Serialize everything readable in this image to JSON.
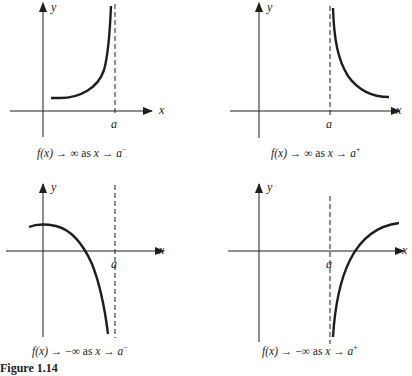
{
  "figure": {
    "caption_label": "Figure 1.14",
    "stroke_color": "#1e1e1e",
    "panels": [
      {
        "id": "top-left",
        "axis_labels": {
          "x": "x",
          "y": "y",
          "asymptote": "a"
        },
        "caption": {
          "f": "f(x)",
          "arrow1": "→",
          "limit": "∞",
          "as": "as",
          "x": "x",
          "arrow2": "→",
          "a": "a",
          "side": "−"
        },
        "description": "f(x) → ∞ as x → a⁻"
      },
      {
        "id": "top-right",
        "axis_labels": {
          "x": "x",
          "y": "y",
          "asymptote": "a"
        },
        "caption": {
          "f": "f(x)",
          "arrow1": "→",
          "limit": "∞",
          "as": "as",
          "x": "x",
          "arrow2": "→",
          "a": "a",
          "side": "+"
        },
        "description": "f(x) → ∞ as x → a⁺"
      },
      {
        "id": "bottom-left",
        "axis_labels": {
          "x": "x",
          "y": "y",
          "asymptote": "a"
        },
        "caption": {
          "f": "f(x)",
          "arrow1": "→",
          "limit": "−∞",
          "as": "as",
          "x": "x",
          "arrow2": "→",
          "a": "a",
          "side": "−"
        },
        "description": "f(x) → −∞ as x → a⁻"
      },
      {
        "id": "bottom-right",
        "axis_labels": {
          "x": "x",
          "y": "y",
          "asymptote": "a"
        },
        "caption": {
          "f": "f(x)",
          "arrow1": "→",
          "limit": "−∞",
          "as": "as",
          "x": "x",
          "arrow2": "→",
          "a": "a",
          "side": "+"
        },
        "description": "f(x) → −∞ as x → a⁺"
      }
    ]
  }
}
